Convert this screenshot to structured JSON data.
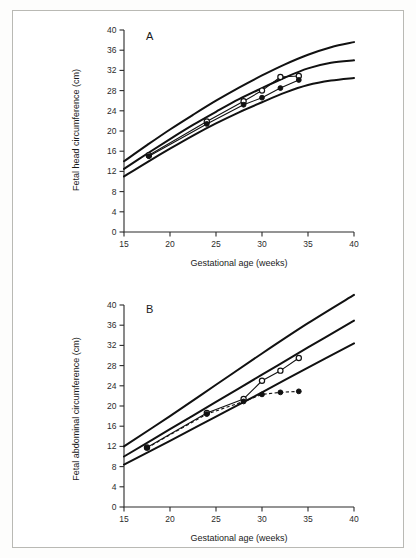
{
  "figure": {
    "background_color": "#ffffff",
    "border_color": "#b9b9b4",
    "line_color": "#111111"
  },
  "panels": [
    {
      "id": "A",
      "letter": "A",
      "xlabel": "Gestational age (weeks)",
      "ylabel": "Fetal head circumference (cm)",
      "xticks": [
        "15",
        "20",
        "25",
        "30",
        "35",
        "40"
      ],
      "yticks": [
        "0",
        "4",
        "8",
        "12",
        "16",
        "20",
        "24",
        "28",
        "32",
        "36",
        "40"
      ]
    },
    {
      "id": "B",
      "letter": "B",
      "xlabel": "Gestational age (weeks)",
      "ylabel": "Fetal abdominal circumference (cm)",
      "xticks": [
        "15",
        "20",
        "25",
        "30",
        "35",
        "40"
      ],
      "yticks": [
        "0",
        "4",
        "8",
        "12",
        "16",
        "20",
        "24",
        "28",
        "32",
        "36",
        "40"
      ]
    }
  ],
  "chart_data": [
    {
      "type": "line",
      "id": "A",
      "title": "A",
      "xlabel": "Gestational age (weeks)",
      "ylabel": "Fetal head circumference (cm)",
      "xlim": [
        15,
        40
      ],
      "ylim": [
        0,
        40
      ],
      "xticks": [
        15,
        20,
        25,
        30,
        35,
        40
      ],
      "yticks": [
        0,
        4,
        8,
        12,
        16,
        20,
        24,
        28,
        32,
        36,
        40
      ],
      "grid": false,
      "legend": "none",
      "series": [
        {
          "name": "Upper centile (reference)",
          "style": "solid-thick",
          "marker": "none",
          "x": [
            15,
            17.5,
            20,
            22.5,
            25,
            27.5,
            30,
            32.5,
            35,
            37.5,
            40
          ],
          "values": [
            14.0,
            17.2,
            20.3,
            23.2,
            26.0,
            28.6,
            31.0,
            33.2,
            35.1,
            36.6,
            37.6
          ]
        },
        {
          "name": "Median centile (reference)",
          "style": "solid-thick",
          "marker": "none",
          "x": [
            15,
            17.5,
            20,
            22.5,
            25,
            27.5,
            30,
            32.5,
            35,
            37.5,
            40
          ],
          "values": [
            12.5,
            15.5,
            18.4,
            21.2,
            23.8,
            26.3,
            28.5,
            30.6,
            32.4,
            33.5,
            34.0
          ]
        },
        {
          "name": "Lower centile (reference)",
          "style": "solid-thick",
          "marker": "none",
          "x": [
            15,
            17.5,
            20,
            22.5,
            25,
            27.5,
            30,
            32.5,
            35,
            37.5,
            40
          ],
          "values": [
            11.0,
            13.8,
            16.5,
            19.1,
            21.5,
            23.7,
            25.7,
            27.6,
            29.1,
            30.0,
            30.5
          ]
        },
        {
          "name": "Fetus 1 (open circle)",
          "style": "solid-thin",
          "marker": "open-circle",
          "x": [
            17.7,
            24.0,
            28.0,
            30.0,
            32.0,
            34.0
          ],
          "values": [
            15.2,
            21.9,
            25.9,
            28.0,
            30.7,
            30.9
          ]
        },
        {
          "name": "Fetus 2 (filled circle)",
          "style": "solid-thin",
          "marker": "filled-circle",
          "x": [
            17.7,
            24.0,
            28.0,
            30.0,
            32.0,
            34.0
          ],
          "values": [
            15.0,
            21.4,
            25.2,
            26.6,
            28.5,
            30.1
          ]
        }
      ]
    },
    {
      "type": "line",
      "id": "B",
      "title": "B",
      "xlabel": "Gestational age (weeks)",
      "ylabel": "Fetal abdominal circumference (cm)",
      "xlim": [
        15,
        40
      ],
      "ylim": [
        0,
        40
      ],
      "xticks": [
        15,
        20,
        25,
        30,
        35,
        40
      ],
      "yticks": [
        0,
        4,
        8,
        12,
        16,
        20,
        24,
        28,
        32,
        36,
        40
      ],
      "grid": false,
      "legend": "none",
      "series": [
        {
          "name": "Upper centile (reference)",
          "style": "solid-thick",
          "marker": "none",
          "x": [
            15,
            20,
            25,
            30,
            35,
            40
          ],
          "values": [
            12.0,
            18.0,
            24.2,
            30.4,
            36.4,
            42.0
          ]
        },
        {
          "name": "Median centile (reference)",
          "style": "solid-thick",
          "marker": "none",
          "x": [
            15,
            20,
            25,
            30,
            35,
            40
          ],
          "values": [
            10.0,
            15.4,
            20.8,
            26.2,
            31.6,
            36.9
          ]
        },
        {
          "name": "Lower centile (reference)",
          "style": "solid-thick",
          "marker": "none",
          "x": [
            15,
            20,
            25,
            30,
            35,
            40
          ],
          "values": [
            8.4,
            13.1,
            17.9,
            22.7,
            27.6,
            32.4
          ]
        },
        {
          "name": "Fetus 1 (open circle)",
          "style": "solid-thin",
          "marker": "open-circle",
          "x": [
            17.5,
            24.0,
            28.0,
            30.0,
            32.0,
            34.0
          ],
          "values": [
            11.8,
            18.6,
            21.4,
            25.0,
            27.0,
            29.5
          ]
        },
        {
          "name": "Fetus 2 (filled circle, dashed)",
          "style": "dashed-thin",
          "marker": "filled-circle",
          "x": [
            17.5,
            24.0,
            28.0,
            30.0,
            32.0,
            34.0
          ],
          "values": [
            11.7,
            18.4,
            20.9,
            22.3,
            22.7,
            22.9
          ]
        }
      ]
    }
  ]
}
